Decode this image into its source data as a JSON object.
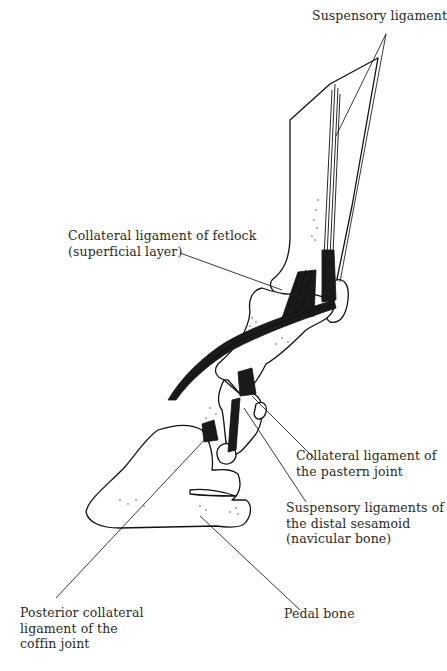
{
  "diagram": {
    "labels": [
      {
        "id": "suspensory-ligament",
        "lines": [
          "Suspensory ligament"
        ]
      },
      {
        "id": "collateral-fetlock",
        "lines": [
          "Collateral ligament of fetlock",
          "(superficial layer)"
        ]
      },
      {
        "id": "collateral-pastern",
        "lines": [
          "Collateral ligament of",
          "the pastern joint"
        ]
      },
      {
        "id": "suspensory-distal-sesamoid",
        "lines": [
          "Suspensory ligaments of",
          "the distal sesamoid",
          "(navicular bone)"
        ]
      },
      {
        "id": "pedal-bone",
        "lines": [
          "Pedal bone"
        ]
      },
      {
        "id": "posterior-collateral-coffin",
        "lines": [
          "Posterior collateral",
          "ligament of the",
          "coffin joint"
        ]
      }
    ],
    "colors": {
      "ink": "#111111",
      "text": "#2a2a2a",
      "background": "#ffffff"
    }
  }
}
